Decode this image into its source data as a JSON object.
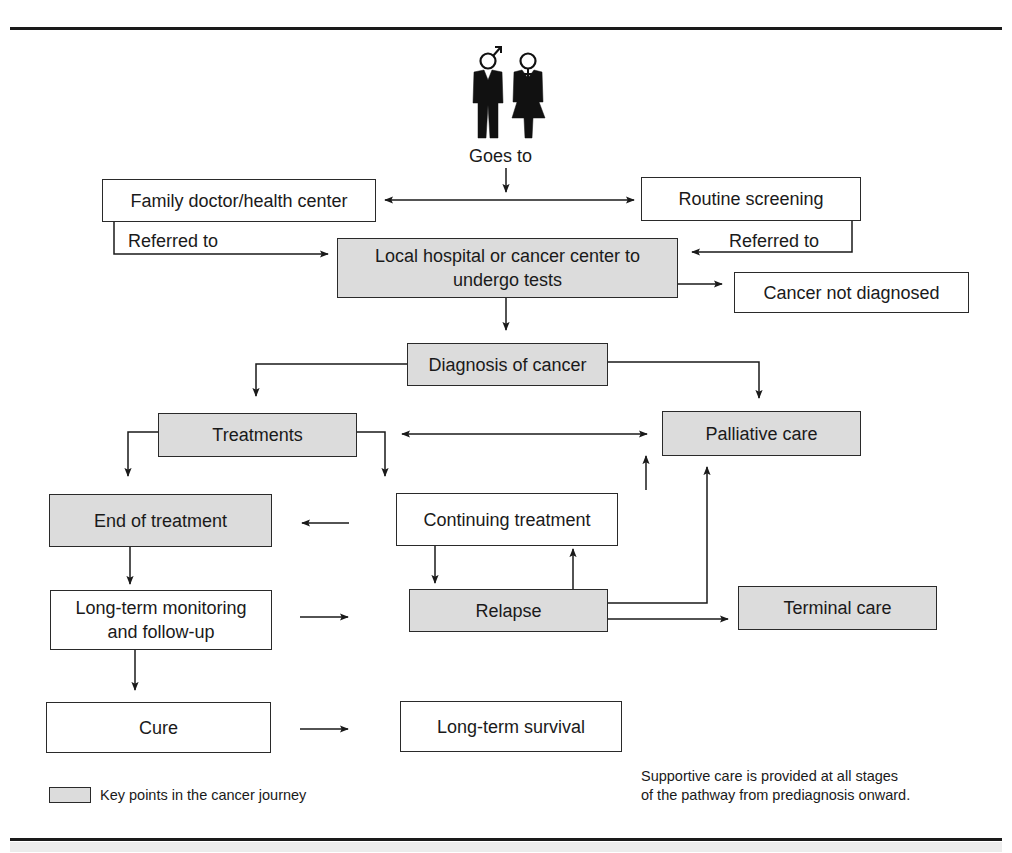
{
  "figure": {
    "intro_label": "Goes to",
    "nodes": {
      "family_doctor": {
        "label": "Family doctor/health center",
        "key_point": false
      },
      "routine_screening": {
        "label": "Routine screening",
        "key_point": false
      },
      "local_hospital": {
        "label_line1": "Local hospital or cancer center to",
        "label_line2": "undergo tests",
        "key_point": true
      },
      "not_diagnosed": {
        "label": "Cancer not diagnosed",
        "key_point": false
      },
      "diagnosis": {
        "label": "Diagnosis of cancer",
        "key_point": true
      },
      "treatments": {
        "label": "Treatments",
        "key_point": true
      },
      "palliative": {
        "label": "Palliative care",
        "key_point": true
      },
      "end_of_treatment": {
        "label": "End of treatment",
        "key_point": true
      },
      "continuing_treatment": {
        "label": "Continuing treatment",
        "key_point": false
      },
      "monitoring": {
        "label_line1": "Long-term monitoring",
        "label_line2": "and follow-up",
        "key_point": false
      },
      "relapse": {
        "label": "Relapse",
        "key_point": true
      },
      "terminal": {
        "label": "Terminal care",
        "key_point": true
      },
      "cure": {
        "label": "Cure",
        "key_point": false
      },
      "survival": {
        "label": "Long-term survival",
        "key_point": false
      }
    },
    "edge_labels": {
      "referred_left": "Referred to",
      "referred_right": "Referred to"
    },
    "legend": {
      "swatch_label": "Key points in the cancer journey"
    },
    "note": {
      "line1": "Supportive care is provided at all stages",
      "line2": "of the pathway from prediagnosis onward."
    },
    "colors": {
      "key_fill": "#dcdcdc",
      "line": "#1a1a1a"
    },
    "icons": [
      "male-figure-icon",
      "female-figure-icon"
    ]
  }
}
